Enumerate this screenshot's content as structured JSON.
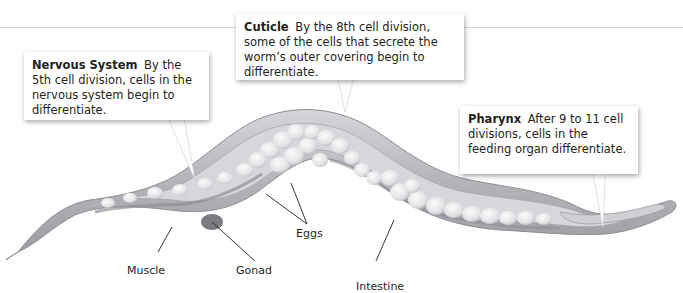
{
  "diagram": {
    "callouts": [
      {
        "title": "Nervous System",
        "text": "By the 5th cell division, cells in the nervous system begin to differentiate."
      },
      {
        "title": "Cuticle",
        "text": "By the 8th cell division, some of the cells that secrete the worm’s outer covering begin to differentiate."
      },
      {
        "title": "Pharynx",
        "text": "After 9 to 11 cell divisions, cells in the feeding organ differentiate."
      }
    ],
    "labels": {
      "muscle": "Muscle",
      "gonad": "Gonad",
      "eggs": "Eggs",
      "intestine": "Intestine"
    },
    "colors": {
      "body_outer": "#b9b9bd",
      "body_inner": "#d9d9dc",
      "muscle_band": "#9b9ba2",
      "egg": "#ececee",
      "egg_shadow": "#c8c8cc",
      "gonad": "#7a7a82",
      "leader_line": "#231f20"
    }
  }
}
